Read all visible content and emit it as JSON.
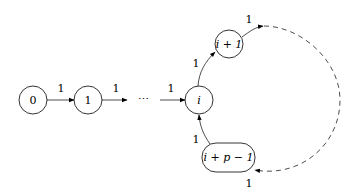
{
  "diagram": {
    "type": "state-transition-graph",
    "nodes": [
      {
        "id": "n0",
        "label": "0"
      },
      {
        "id": "n1",
        "label": "1"
      },
      {
        "id": "ndots",
        "label": "⋯"
      },
      {
        "id": "ni",
        "label": "i"
      },
      {
        "id": "ni1",
        "label": "i + 1"
      },
      {
        "id": "nip",
        "label": "i + p − 1"
      }
    ],
    "edges": [
      {
        "from": "n0",
        "to": "n1",
        "label": "1",
        "style": "solid"
      },
      {
        "from": "n1",
        "to": "ndots",
        "label": "1",
        "style": "solid"
      },
      {
        "from": "ndots",
        "to": "ni",
        "label": "1",
        "style": "solid"
      },
      {
        "from": "ni",
        "to": "ni1",
        "label": "1",
        "style": "solid"
      },
      {
        "from": "ni1",
        "to": "arc",
        "label": "1",
        "style": "solid"
      },
      {
        "from": "arc",
        "to": "nip",
        "label": "1",
        "style": "dashed"
      },
      {
        "from": "nip",
        "to": "ni",
        "label": "1",
        "style": "solid"
      }
    ]
  }
}
